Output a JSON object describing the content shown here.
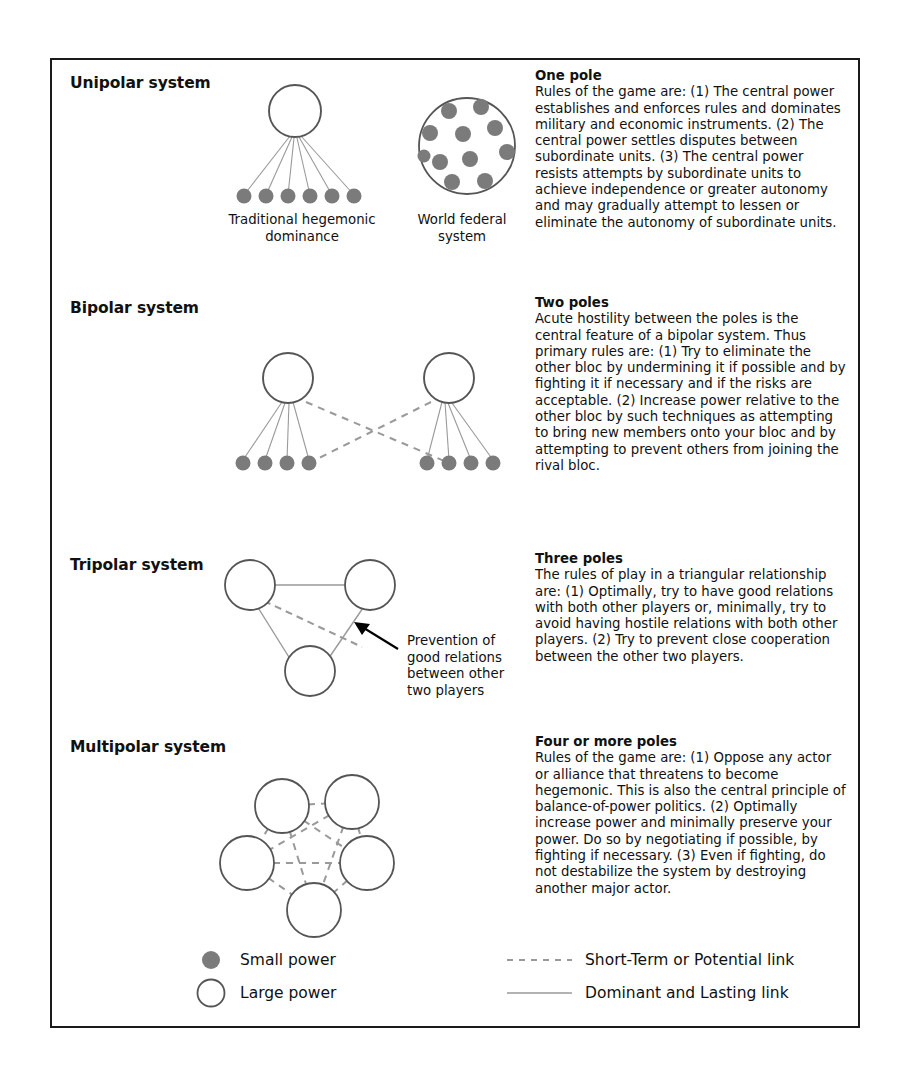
{
  "figure": {
    "sections": [
      {
        "id": "unipolar",
        "title": "Unipolar system",
        "heading": "One pole",
        "body": "Rules of the game are: (1) The central power establishes and enforces rules and dominates military and economic instruments. (2) The central power settles disputes between subordinate units. (3) The central power resists attempts by subordinate units to achieve independence or greater autonomy and may gradually attempt to lessen or eliminate the autonomy of subordinate units.",
        "captions": [
          "Traditional hegemonic dominance",
          "World federal system"
        ]
      },
      {
        "id": "bipolar",
        "title": "Bipolar system",
        "heading": "Two poles",
        "body": "Acute hostility between the poles is the central feature of a bipolar system. Thus primary rules are: (1) Try to eliminate the other bloc by undermining it if possible and by fighting it if necessary and if the risks are acceptable. (2) Increase power relative to the other bloc by such techniques as attempting to bring new members onto your bloc and by attempting to prevent others from joining the rival bloc.",
        "captions": []
      },
      {
        "id": "tripolar",
        "title": "Tripolar system",
        "heading": "Three poles",
        "body": "The rules of play in a triangular relationship are: (1) Optimally, try to have good relations with both other players or, minimally, try to avoid having hostile relations with both other players. (2) Try to prevent close cooperation between the other two players.",
        "annotation": "Prevention of good relations between other two players",
        "captions": []
      },
      {
        "id": "multipolar",
        "title": "Multipolar system",
        "heading": "Four or more poles",
        "body": "Rules of the game are: (1) Oppose any actor or alliance that threatens to become hegemonic. This is also the central principle of balance-of-power politics. (2) Optimally increase power and minimally preserve your power. Do so by negotiating if possible, by fighting if necessary. (3) Even if fighting, do not destabilize the system by destroying another major actor.",
        "captions": []
      }
    ],
    "legend": {
      "small_power": "Small power",
      "large_power": "Large power",
      "short_term_link": "Short-Term or Potential link",
      "dominant_link": "Dominant and Lasting link"
    },
    "colors": {
      "small_power_fill": "#7b7b7b",
      "large_power_stroke": "#555555",
      "solid_link": "#9a9a9a",
      "dashed_link": "#9a9a9a",
      "border": "#1a1a1a",
      "text": "#111111"
    }
  }
}
